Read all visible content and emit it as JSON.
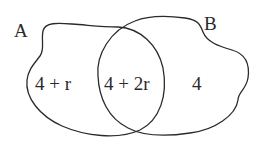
{
  "diagram": {
    "type": "venn",
    "sets": [
      {
        "id": "A",
        "label": "A"
      },
      {
        "id": "B",
        "label": "B"
      }
    ],
    "regions": [
      {
        "id": "A_only",
        "sets": [
          "A"
        ],
        "label": "4 + r"
      },
      {
        "id": "A_and_B",
        "sets": [
          "A",
          "B"
        ],
        "label": "4 + 2r"
      },
      {
        "id": "B_only",
        "sets": [
          "B"
        ],
        "label": "4"
      }
    ],
    "colors": {
      "stroke": "#2a2a2a",
      "text": "#2a2a2a",
      "background": "#ffffff"
    }
  }
}
